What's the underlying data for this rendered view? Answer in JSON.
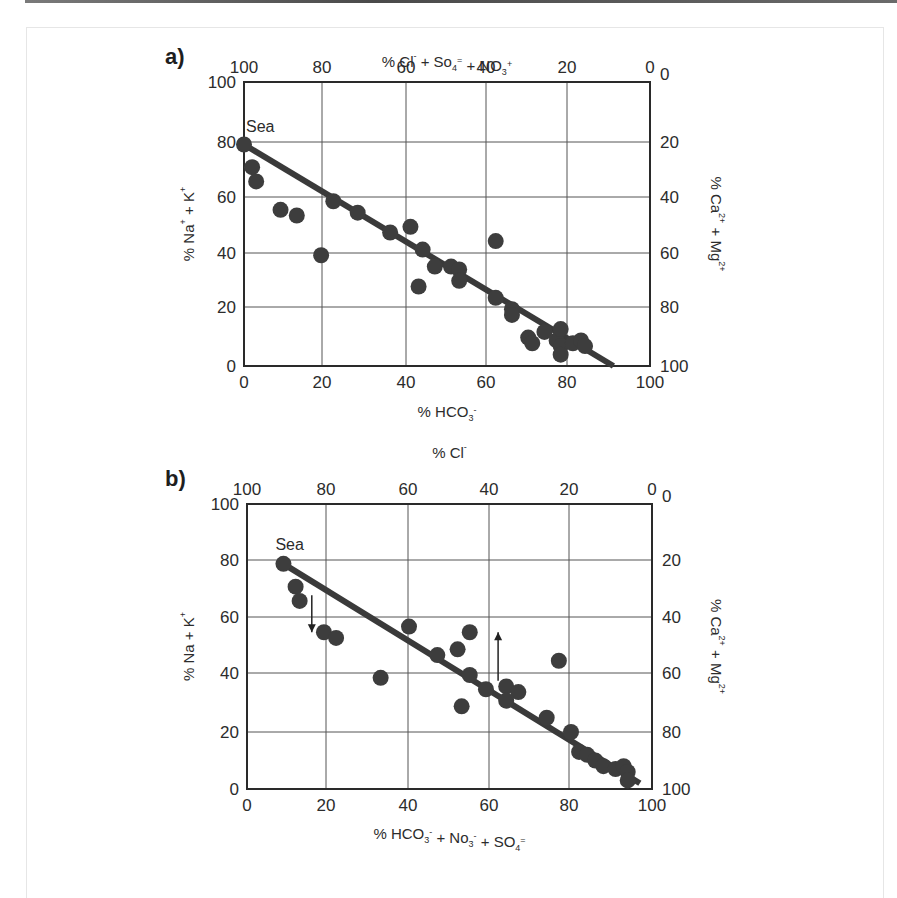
{
  "figure": {
    "panels": [
      "a)",
      "b)"
    ]
  },
  "chart_data": [
    {
      "type": "scatter",
      "panel_label": "a)",
      "title": "",
      "xlabel": "% HCO3-",
      "xlabel_parts": {
        "main": "% HCO",
        "sub": "3",
        "sup": "-"
      },
      "ylabel": "% Na+ + K+",
      "top_xlabel": "% Cl- + So4= + NO3+",
      "right_ylabel": "% Ca2+ + Mg2+",
      "xlim": [
        0,
        100
      ],
      "ylim": [
        0,
        100
      ],
      "x_ticks": [
        0,
        20,
        40,
        60,
        80,
        100
      ],
      "y_ticks": [
        0,
        20,
        40,
        60,
        80,
        100
      ],
      "top_ticks": [
        100,
        80,
        60,
        40,
        20,
        0
      ],
      "right_ticks": [
        100,
        80,
        60,
        40,
        20,
        0
      ],
      "grid": true,
      "annotations": [
        {
          "text": "Sea",
          "x": 0,
          "y": 78
        }
      ],
      "regression_line": {
        "x": [
          0,
          91
        ],
        "y": [
          78,
          0
        ]
      },
      "points": {
        "x": [
          0,
          2,
          3,
          9,
          13,
          19,
          22,
          28,
          36,
          41,
          44,
          43,
          47,
          51,
          53,
          53,
          62,
          62,
          66,
          66,
          70,
          71,
          74,
          77,
          78,
          78,
          78,
          81,
          83,
          84
        ],
        "y": [
          78,
          70,
          65,
          55,
          53,
          39,
          58,
          54,
          47,
          49,
          41,
          28,
          35,
          35,
          34,
          30,
          44,
          24,
          20,
          18,
          10,
          8,
          12,
          9,
          13,
          7,
          4,
          8,
          9,
          7
        ]
      }
    },
    {
      "type": "scatter",
      "panel_label": "b)",
      "title": "",
      "xlabel": "% HCO3- + No3- + SO4=",
      "ylabel": "% Na + K+",
      "top_xlabel": "% Cl-",
      "right_ylabel": "% Ca2+ + Mg2+",
      "xlim": [
        0,
        100
      ],
      "ylim": [
        0,
        100
      ],
      "x_ticks": [
        0,
        20,
        40,
        60,
        80,
        100
      ],
      "y_ticks": [
        0,
        20,
        40,
        60,
        80,
        100
      ],
      "top_ticks": [
        100,
        80,
        60,
        40,
        20,
        0
      ],
      "right_ticks": [
        100,
        80,
        60,
        40,
        20,
        0
      ],
      "grid": true,
      "annotations": [
        {
          "text": "Sea",
          "x": 9,
          "y": 79
        },
        {
          "type": "arrow-down",
          "x": 16,
          "y_from": 68,
          "y_to": 55
        },
        {
          "type": "arrow-up",
          "x": 62,
          "y_from": 38,
          "y_to": 55
        }
      ],
      "regression_line": {
        "x": [
          9,
          97
        ],
        "y": [
          79,
          2
        ]
      },
      "points": {
        "x": [
          9,
          12,
          13,
          19,
          22,
          33,
          40,
          47,
          52,
          55,
          55,
          53,
          59,
          64,
          67,
          64,
          77,
          74,
          80,
          82,
          84,
          86,
          88,
          91,
          93,
          94,
          94
        ],
        "y": [
          79,
          71,
          66,
          55,
          53,
          39,
          57,
          47,
          49,
          55,
          40,
          29,
          35,
          36,
          34,
          31,
          45,
          25,
          20,
          13,
          12,
          10,
          8,
          7,
          8,
          6,
          3
        ]
      }
    }
  ],
  "colors": {
    "marker": "#3d3d3d",
    "line": "#3a3a3a",
    "grid": "#555555",
    "axis": "#2a2a2a"
  }
}
